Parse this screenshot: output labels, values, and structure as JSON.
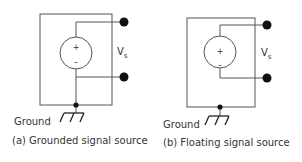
{
  "diagrams": [
    {
      "id": "a",
      "caption": "(a) Grounded signal source",
      "ground_label": "Ground",
      "voltage_label": "V",
      "voltage_subscript": "s",
      "plus": "+",
      "minus": "–",
      "source_negative_grounded": true
    },
    {
      "id": "b",
      "caption": "(b) Floating signal source",
      "ground_label": "Ground",
      "voltage_label": "V",
      "voltage_subscript": "s",
      "plus": "+",
      "minus": "–",
      "source_negative_grounded": false
    }
  ],
  "colors": {
    "line": "#555555",
    "node": "#111111",
    "text": "#333333"
  }
}
